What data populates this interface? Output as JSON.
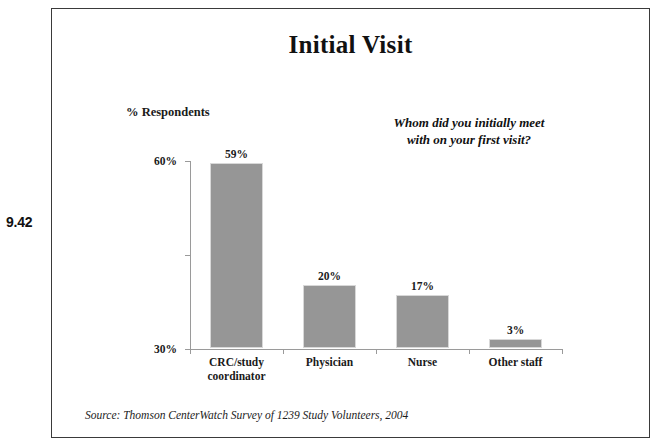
{
  "slide": {
    "number": "9.42",
    "title": "Initial Visit",
    "question_callout": "Whom did you initially meet with on your first visit?",
    "source_note": "Source: Thomson CenterWatch Survey of 1239 Study Volunteers, 2004",
    "frame_border_color": "#3a3a3a"
  },
  "chart_data": {
    "type": "bar",
    "title": "Initial Visit",
    "xlabel": "",
    "ylabel": "% Respondents",
    "categories": [
      "CRC/study coordinator",
      "Physician",
      "Nurse",
      "Other staff"
    ],
    "values": [
      59,
      20,
      17,
      3
    ],
    "value_labels": [
      "59%",
      "20%",
      "17%",
      "3%"
    ],
    "ylim": [
      0,
      60
    ],
    "yticks": [
      0,
      30,
      60
    ],
    "ytick_labels": [
      "0%",
      "30%",
      "60%"
    ],
    "grid": false,
    "legend": false,
    "bar_color": "#969696",
    "axis_color": "#9a9a9a",
    "annotation": "Whom did you initially meet with on your first visit?",
    "source": "Source: Thomson CenterWatch Survey of 1239 Study Volunteers, 2004"
  }
}
